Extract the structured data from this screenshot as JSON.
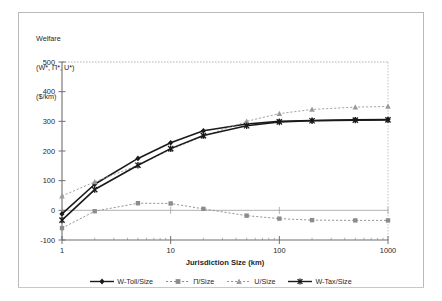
{
  "chart_data": {
    "type": "line",
    "title": "Welfare\n(W*, Π*, U*)\n($/km)",
    "title_lines": [
      "Welfare",
      "(W*, Π*, U*)",
      "($/km)"
    ],
    "xlabel": "Jurisdiction Size (km)",
    "ylabel": "",
    "xscale": "log",
    "xlim": [
      1,
      1000
    ],
    "ylim": [
      -100,
      500
    ],
    "grid": false,
    "legend_position": "bottom",
    "xticks": [
      1,
      10,
      100,
      1000
    ],
    "xtick_labels": [
      "1",
      "10",
      "100",
      "1000"
    ],
    "yticks": [
      -100,
      0,
      100,
      200,
      300,
      400,
      500
    ],
    "ytick_labels": [
      "-100",
      "0",
      "100",
      "200",
      "300",
      "400",
      "500"
    ],
    "x": [
      1,
      2,
      5,
      10,
      20,
      50,
      100,
      200,
      500,
      1000
    ],
    "series": [
      {
        "name": "W-Toll/Size",
        "marker": "diamond",
        "color": "#1a1a1a",
        "linestyle": "solid",
        "values": [
          -12,
          88,
          175,
          228,
          268,
          291,
          300,
          303,
          305,
          306
        ]
      },
      {
        "name": "Π/Size",
        "marker": "square",
        "color": "#8c8c8c",
        "linestyle": "dotted",
        "values": [
          -60,
          -3,
          24,
          23,
          5,
          -18,
          -28,
          -33,
          -34,
          -34
        ]
      },
      {
        "name": "U/Size",
        "marker": "triangle",
        "color": "#9a9a9a",
        "linestyle": "dotted",
        "values": [
          48,
          96,
          152,
          205,
          250,
          300,
          326,
          340,
          348,
          350
        ]
      },
      {
        "name": "W-Tax/Size",
        "marker": "star",
        "color": "#1a1a1a",
        "linestyle": "solid",
        "values": [
          -33,
          70,
          152,
          208,
          252,
          285,
          298,
          302,
          304,
          305
        ]
      }
    ]
  },
  "legend": {
    "items": [
      {
        "label": "W-Toll/Size"
      },
      {
        "label": "Π/Size"
      },
      {
        "label": "U/Size"
      },
      {
        "label": "W-Tax/Size"
      }
    ]
  }
}
